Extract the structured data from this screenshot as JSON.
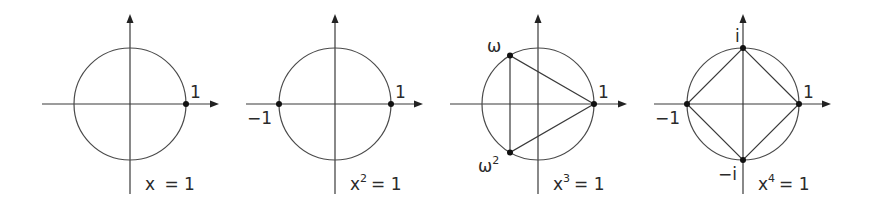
{
  "figure": {
    "panels": [
      {
        "id": "n1",
        "equation": {
          "base": "x",
          "exponent": "",
          "rest": "= 1"
        },
        "center": [
          130,
          104
        ],
        "radius": 56,
        "points": [
          {
            "label": "1",
            "angle_deg": 0
          }
        ],
        "polygon": false
      },
      {
        "id": "n2",
        "equation": {
          "base": "x",
          "exponent": "2",
          "rest": "= 1"
        },
        "center": [
          335,
          104
        ],
        "radius": 56,
        "points": [
          {
            "label": "1",
            "angle_deg": 0
          },
          {
            "label": "−1",
            "angle_deg": 180
          }
        ],
        "polygon": false
      },
      {
        "id": "n3",
        "equation": {
          "base": "x",
          "exponent": "3",
          "rest": "= 1"
        },
        "center": [
          538,
          104
        ],
        "radius": 56,
        "points": [
          {
            "label": "1",
            "angle_deg": 0
          },
          {
            "label": "ω",
            "angle_deg": 120
          },
          {
            "label": "ω²",
            "angle_deg": 240
          }
        ],
        "polygon": true
      },
      {
        "id": "n4",
        "equation": {
          "base": "x",
          "exponent": "4",
          "rest": "= 1"
        },
        "center": [
          743,
          104
        ],
        "radius": 56,
        "points": [
          {
            "label": "1",
            "angle_deg": 0
          },
          {
            "label": "i",
            "angle_deg": 90
          },
          {
            "label": "−1",
            "angle_deg": 180
          },
          {
            "label": "−i",
            "angle_deg": 270
          }
        ],
        "polygon": true
      }
    ],
    "labels": {
      "p1_one": "1",
      "p1_eq_base": "x",
      "p1_eq_rest": "= 1",
      "p2_one": "1",
      "p2_neg_one": "−1",
      "p2_eq_base": "x",
      "p2_eq_exp": "2",
      "p2_eq_rest": "= 1",
      "p3_one": "1",
      "p3_omega": "ω",
      "p3_omega2_base": "ω",
      "p3_omega2_exp": "2",
      "p3_eq_base": "x",
      "p3_eq_exp": "3",
      "p3_eq_rest": "= 1",
      "p4_one": "1",
      "p4_i": "i",
      "p4_neg_one": "−1",
      "p4_neg_i": "−i",
      "p4_eq_base": "x",
      "p4_eq_exp": "4",
      "p4_eq_rest": "= 1"
    },
    "colors": {
      "line": "#3a3a3a",
      "point": "#111111",
      "background": "#ffffff"
    }
  }
}
